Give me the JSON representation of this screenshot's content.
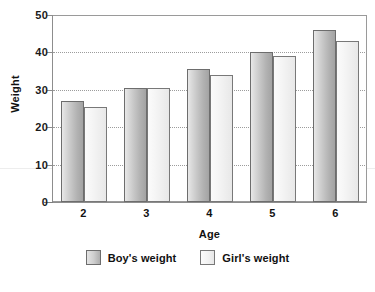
{
  "chart_data": {
    "type": "bar",
    "title": "",
    "xlabel": "Age",
    "ylabel": "Weight",
    "categories": [
      "2",
      "3",
      "4",
      "5",
      "6"
    ],
    "series": [
      {
        "name": "Boy's weight",
        "values": [
          27,
          30.5,
          35.5,
          40,
          46
        ],
        "color": "#b6b6b6"
      },
      {
        "name": "Girl's weight",
        "values": [
          25.5,
          30.5,
          34,
          39,
          43
        ],
        "color": "#efefef"
      }
    ],
    "ylim": [
      0,
      50
    ],
    "yticks": [
      "0",
      "10",
      "20",
      "30",
      "40",
      "50"
    ],
    "ytick_values": [
      0,
      10,
      20,
      30,
      40,
      50
    ],
    "gridlines": [
      10,
      20,
      30,
      40
    ],
    "grid": true,
    "grid_style": "dotted",
    "legend_position": "bottom",
    "legend": [
      "Boy's weight",
      "Girl's weight"
    ]
  },
  "axes": {
    "y_title": "Weight",
    "x_title": "Age"
  },
  "legend": {
    "items": [
      {
        "label": "Boy's weight"
      },
      {
        "label": "Girl's weight"
      }
    ]
  },
  "title_remnant": ""
}
